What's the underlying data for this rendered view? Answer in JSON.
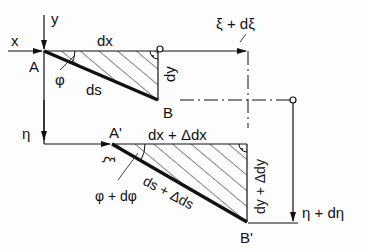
{
  "diagram": {
    "colors": {
      "ink": "#111111",
      "background": "#fdfdfd"
    },
    "axes": {
      "x_label": "x",
      "y_label": "y",
      "eta_label": "η",
      "xi_label": "ξ",
      "xi_plus_dxi_label": "ξ + dξ",
      "eta_plus_deta_label": "η + dη"
    },
    "original_element": {
      "point_a": "A",
      "point_b": "B",
      "dx_label": "dx",
      "dy_label": "dy",
      "ds_label": "ds",
      "angle_label": "φ"
    },
    "deformed_element": {
      "point_a": "A'",
      "point_b": "B'",
      "dx_label": "dx + Δdx",
      "dy_label": "dy + Δdy",
      "ds_label": "ds + Δds",
      "angle_label": "φ + dφ"
    }
  }
}
